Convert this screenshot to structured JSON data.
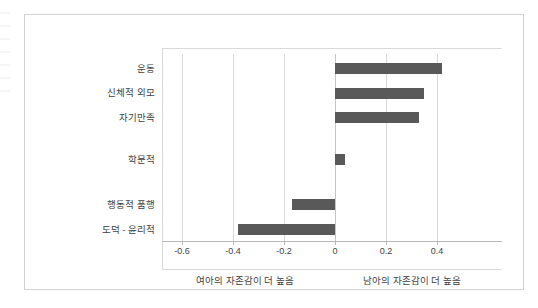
{
  "chart_data": {
    "type": "bar",
    "orientation": "horizontal",
    "title": "",
    "xlabel": "",
    "ylabel": "",
    "categories": [
      "운동",
      "신체적 외모",
      "자기만족",
      "학문적",
      "행동적 품행",
      "도덕 - 윤리적"
    ],
    "values": [
      0.42,
      0.35,
      0.33,
      0.04,
      -0.17,
      -0.38
    ],
    "series": [
      {
        "name": "자존감 성차 효과크기",
        "values": [
          0.42,
          0.35,
          0.33,
          0.04,
          -0.17,
          -0.38
        ]
      }
    ],
    "xlim": [
      -0.66,
      0.67
    ],
    "xticks": [
      -0.6,
      -0.4,
      -0.2,
      0,
      0.2,
      0.4
    ],
    "xtick_labels": [
      "-0.6",
      "-0.4",
      "-0.2",
      "0",
      "0.2",
      "0.4"
    ],
    "grid": true,
    "grid_axis": "x",
    "legend": false,
    "bar_color": "#595959",
    "gridline_color": "#d9d9d9",
    "axis_color": "#b7b7b7",
    "annotations": [
      {
        "name": "left-direction-note",
        "text": "여아의 자존감이 더 높음",
        "position": "below-axis-left"
      },
      {
        "name": "right-direction-note",
        "text": "남아의 자존감이 더 높음",
        "position": "below-axis-right"
      }
    ]
  },
  "figure": {
    "border_color": "#d2d2d2",
    "background": "#ffffff"
  }
}
